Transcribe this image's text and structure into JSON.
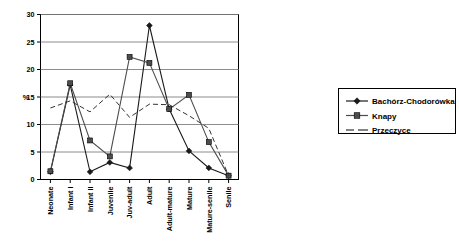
{
  "chart_data": {
    "type": "line",
    "title": "",
    "xlabel": "",
    "ylabel": "%",
    "ylim": [
      0,
      30
    ],
    "ytick_step": 5,
    "yticks": [
      "0",
      "5",
      "10",
      "15",
      "20",
      "25",
      "30"
    ],
    "grid": true,
    "legend_position": "right",
    "categories": [
      "Neonate",
      "Infant I",
      "Infant II",
      "Juvenile",
      "Juv-adult",
      "Adult",
      "Adult-mature",
      "Mature",
      "Mature-senile",
      "Senile"
    ],
    "series": [
      {
        "name": "Bachórz-Chodorówka",
        "marker": "diamond",
        "style": "solid",
        "color": "#1a1a1a",
        "values": [
          1.4,
          17.2,
          1.4,
          3.1,
          2.1,
          28.0,
          12.8,
          5.2,
          2.1,
          0.7
        ]
      },
      {
        "name": "Knapy",
        "marker": "square",
        "style": "solid",
        "color": "#4d4d4d",
        "values": [
          1.5,
          17.5,
          7.1,
          4.2,
          22.3,
          21.2,
          12.8,
          15.4,
          6.8,
          0.7
        ]
      },
      {
        "name": "Przeczyce",
        "marker": "none",
        "style": "dashed",
        "color": "#333333",
        "values": [
          13.0,
          14.3,
          12.3,
          15.5,
          11.3,
          13.7,
          13.6,
          11.6,
          9.3,
          0.7
        ]
      }
    ]
  },
  "legend": {
    "items": [
      {
        "label": "Bachórz-Chodorówka",
        "marker": "diamond"
      },
      {
        "label": "Knapy",
        "marker": "square"
      },
      {
        "label": "Przeczyce",
        "marker": "dash"
      }
    ]
  }
}
